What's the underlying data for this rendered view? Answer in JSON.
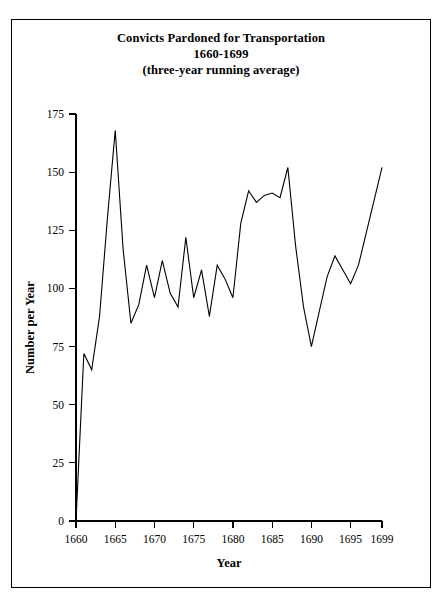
{
  "figure": {
    "title_lines": [
      "Convicts Pardoned for Transportation",
      "1660-1699",
      "(three-year running average)"
    ]
  },
  "chart_data": {
    "type": "line",
    "title": "Convicts Pardoned for Transportation 1660-1699 (three-year running average)",
    "xlabel": "Year",
    "ylabel": "Number per Year",
    "xlim": [
      1660,
      1699
    ],
    "ylim": [
      0,
      175
    ],
    "ytick_values": [
      0,
      25,
      50,
      75,
      100,
      125,
      150,
      175
    ],
    "ytick_labels": [
      "0",
      "25",
      "50",
      "75",
      "100",
      "125",
      "150",
      "175"
    ],
    "xtick_values": [
      1660,
      1665,
      1670,
      1675,
      1680,
      1685,
      1690,
      1695,
      1699
    ],
    "xtick_labels": [
      "1660",
      "1665",
      "1670",
      "1675",
      "1680",
      "1685",
      "1690",
      "1695",
      "1699"
    ],
    "grid": false,
    "legend": null,
    "series": [
      {
        "name": "Convicts pardoned per year (three-year running average)",
        "color": "#000000",
        "x": [
          1660,
          1661,
          1662,
          1663,
          1664,
          1665,
          1666,
          1667,
          1668,
          1669,
          1670,
          1671,
          1672,
          1673,
          1674,
          1675,
          1676,
          1677,
          1678,
          1679,
          1680,
          1681,
          1682,
          1683,
          1684,
          1685,
          1686,
          1687,
          1688,
          1689,
          1690,
          1691,
          1692,
          1693,
          1694,
          1695,
          1696,
          1697,
          1698,
          1699
        ],
        "values": [
          0,
          72,
          65,
          88,
          130,
          168,
          117,
          85,
          93,
          110,
          96,
          112,
          98,
          92,
          122,
          96,
          108,
          88,
          110,
          104,
          96,
          128,
          142,
          137,
          140,
          141,
          139,
          152,
          118,
          92,
          75,
          90,
          105,
          114,
          108,
          102,
          110,
          124,
          138,
          152
        ]
      }
    ]
  }
}
